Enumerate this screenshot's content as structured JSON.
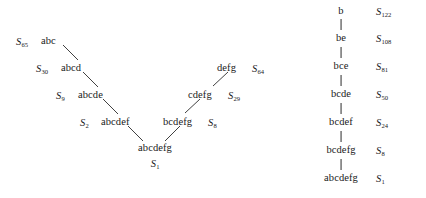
{
  "figure": {
    "kind": "two-panel-sequence-diagram",
    "line_color": "#2b2b2b",
    "text_color": "#1a1a1a",
    "background": "#ffffff"
  },
  "tree": {
    "name": "converging-merge-tree",
    "left_chain": [
      {
        "node": "abc",
        "s_symbol": "S",
        "s_index": "65",
        "label_side": "left"
      },
      {
        "node": "abcd",
        "s_symbol": "S",
        "s_index": "30",
        "label_side": "left"
      },
      {
        "node": "abcde",
        "s_symbol": "S",
        "s_index": "9",
        "label_side": "left"
      },
      {
        "node": "abcdef",
        "s_symbol": "S",
        "s_index": "2",
        "label_side": "left"
      }
    ],
    "right_chain": [
      {
        "node": "defg",
        "s_symbol": "S",
        "s_index": "64",
        "label_side": "right"
      },
      {
        "node": "cdefg",
        "s_symbol": "S",
        "s_index": "29",
        "label_side": "right"
      },
      {
        "node": "bcdefg",
        "s_symbol": "S",
        "s_index": "8",
        "label_side": "right"
      }
    ],
    "root": {
      "node": "abcdefg",
      "s_symbol": "S",
      "s_index": "1",
      "label_side": "below"
    }
  },
  "chain": {
    "name": "linear-sequence-chain",
    "items": [
      {
        "node": "b",
        "s_symbol": "S",
        "s_index": "122"
      },
      {
        "node": "be",
        "s_symbol": "S",
        "s_index": "108"
      },
      {
        "node": "bce",
        "s_symbol": "S",
        "s_index": "81"
      },
      {
        "node": "bcde",
        "s_symbol": "S",
        "s_index": "50"
      },
      {
        "node": "bcdef",
        "s_symbol": "S",
        "s_index": "24"
      },
      {
        "node": "bcdefg",
        "s_symbol": "S",
        "s_index": "8"
      },
      {
        "node": "abcdefg",
        "s_symbol": "S",
        "s_index": "1"
      }
    ]
  }
}
